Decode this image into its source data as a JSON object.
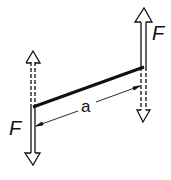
{
  "diagram": {
    "type": "force-couple",
    "labels": {
      "force_top": "F",
      "force_bottom": "F",
      "distance": "a"
    },
    "colors": {
      "stroke": "#111111",
      "background": "#ffffff"
    }
  }
}
